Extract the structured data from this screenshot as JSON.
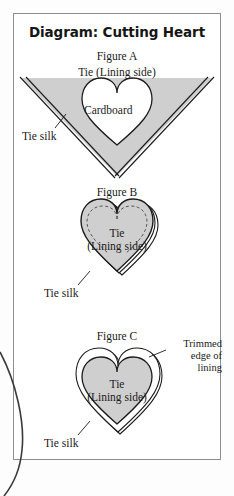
{
  "document": {
    "title": "Diagram: Cutting Heart",
    "kind": "sewing-instruction-diagram",
    "frame_color": "#8e8e8e",
    "fabric_fill": "#cfcfcf",
    "ink_color": "#1b1b1b",
    "paper_color": "#ffffff"
  },
  "figures": [
    {
      "id": "figure-a",
      "label": "Figure A",
      "top_label": "Tie (Lining side)",
      "inner_label": "Cardboard",
      "leader_label": "Tie silk",
      "description": "Grey V of tie silk, lining side up, with a white heart of cardboard laid on top"
    },
    {
      "id": "figure-b",
      "label": "Figure B",
      "inner_label_line1": "Tie",
      "inner_label_line2": "(Lining side)",
      "leader_label": "Tie silk",
      "description": "Grey heart with dashed stitching line near the upper edge and silk folded behind"
    },
    {
      "id": "figure-c",
      "label": "Figure C",
      "inner_label_line1": "Tie",
      "inner_label_line2": "(Lining side)",
      "leader_label": "Tie silk",
      "side_label_line1": "Trimmed",
      "side_label_line2": "edge of",
      "side_label_line3": "lining",
      "description": "Grey heart surrounded by a trimmed white band of lining"
    }
  ]
}
